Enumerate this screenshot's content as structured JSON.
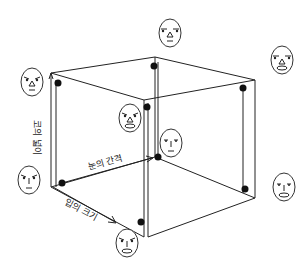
{
  "diagram": {
    "type": "3d-cube-chernoff-faces",
    "axes": {
      "vertical": {
        "label": "코의 넓이"
      },
      "depth_right": {
        "label": "눈의 간격"
      },
      "depth_front": {
        "label": "입의 크기"
      }
    },
    "colors": {
      "line": "#222222",
      "dot": "#111111",
      "background": "#ffffff"
    },
    "faces": [
      {
        "id": "top-center",
        "cx": 170,
        "cy": 33,
        "eye": "wide-flat",
        "nose": "triangle",
        "mouth": "small"
      },
      {
        "id": "top-right",
        "cx": 282,
        "cy": 60,
        "eye": "wide-flat",
        "nose": "triangle",
        "mouth": "wide-oval"
      },
      {
        "id": "left-upper",
        "cx": 32,
        "cy": 82,
        "eye": "slanted",
        "nose": "triangle",
        "mouth": "small"
      },
      {
        "id": "center-upper",
        "cx": 130,
        "cy": 118,
        "eye": "slanted",
        "nose": "triangle",
        "mouth": "wide-oval"
      },
      {
        "id": "center-middle",
        "cx": 171,
        "cy": 143,
        "eye": "narrow",
        "nose": "line",
        "mouth": "small"
      },
      {
        "id": "left-lower",
        "cx": 29,
        "cy": 180,
        "eye": "slanted",
        "nose": "line",
        "mouth": "small"
      },
      {
        "id": "right-lower",
        "cx": 284,
        "cy": 187,
        "eye": "narrow",
        "nose": "line",
        "mouth": "wide-oval"
      },
      {
        "id": "bottom-center",
        "cx": 127,
        "cy": 243,
        "eye": "slanted",
        "nose": "line",
        "mouth": "wide-oval"
      }
    ]
  }
}
